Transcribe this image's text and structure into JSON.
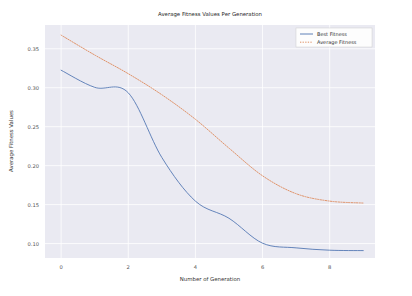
{
  "figure": {
    "title": "Average Fitness Values Per Generation",
    "background_color": "#ffffff",
    "axes_background_color": "#eaeaf2",
    "grid_color": "#ffffff"
  },
  "axes": {
    "xlabel": "Number of Generation",
    "ylabel": "Average Fitness Values",
    "xticks": [
      "0",
      "2",
      "4",
      "6",
      "8"
    ],
    "yticks": [
      "0.10",
      "0.15",
      "0.20",
      "0.25",
      "0.30",
      "0.35"
    ]
  },
  "legend": {
    "position": "upper right",
    "entries": [
      {
        "label": "Best Fitness",
        "style": "solid",
        "color": "#4c72b0"
      },
      {
        "label": "Average Fitness",
        "style": "dotted",
        "color": "#dd8452"
      }
    ]
  },
  "chart_data": {
    "type": "line",
    "title": "Average Fitness Values Per Generation",
    "xlabel": "Number of Generation",
    "ylabel": "Average Fitness Values",
    "xlim": [
      -0.48,
      9.35
    ],
    "ylim": [
      0.0815,
      0.3805
    ],
    "grid": true,
    "legend_position": "upper right",
    "x": [
      0,
      1,
      2,
      3,
      4,
      5,
      6,
      7,
      8,
      9
    ],
    "series": [
      {
        "name": "Best Fitness",
        "style": "solid",
        "color": "#4c72b0",
        "values": [
          0.3225,
          0.3005,
          0.2935,
          0.2105,
          0.1545,
          0.1325,
          0.1005,
          0.0945,
          0.0915,
          0.091
        ]
      },
      {
        "name": "Average Fitness",
        "style": "dotted",
        "color": "#dd8452",
        "values": [
          0.3675,
          0.342,
          0.318,
          0.291,
          0.2595,
          0.2225,
          0.187,
          0.164,
          0.1545,
          0.152
        ]
      }
    ]
  }
}
